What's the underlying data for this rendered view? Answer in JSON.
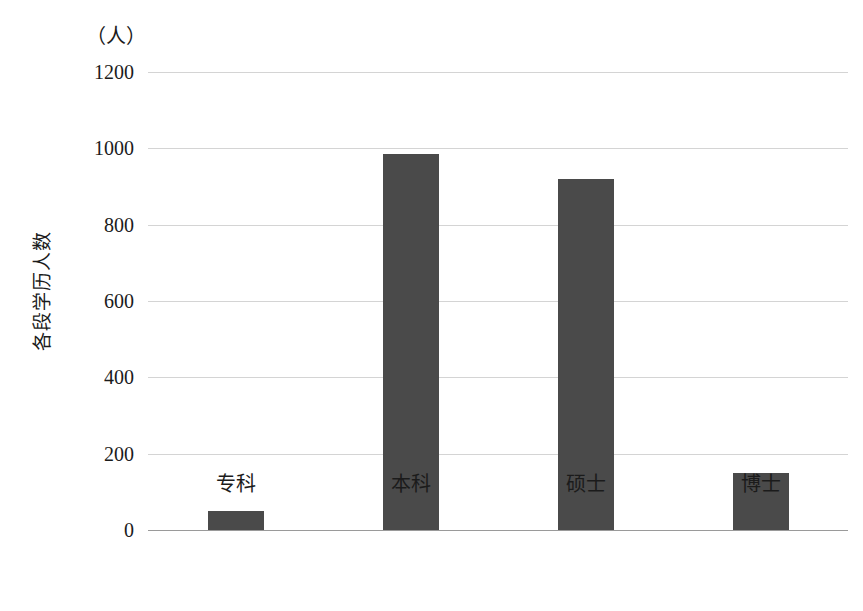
{
  "chart_data": {
    "type": "bar",
    "title": "",
    "subtitle": "",
    "unit_label": "（人）",
    "xlabel": "",
    "ylabel": "各段学历人数",
    "categories": [
      "专科",
      "本科",
      "硕士",
      "博士"
    ],
    "values": [
      50,
      985,
      920,
      150
    ],
    "series": [
      {
        "name": "各段学历人数",
        "values": [
          50,
          985,
          920,
          150
        ]
      }
    ],
    "ylim": [
      0,
      1200
    ],
    "ytick_labels": [
      "0",
      "200",
      "400",
      "600",
      "800",
      "1000",
      "1200"
    ],
    "ytick_values": [
      0,
      200,
      400,
      600,
      800,
      1000,
      1200
    ],
    "grid": "horizontal",
    "legend": "none",
    "colors": {
      "bar": "#4a4a4a",
      "gridline": "#d4d4d4",
      "axis": "#9a9a9a",
      "background": "#ffffff",
      "text": "#1b1b1b"
    }
  }
}
